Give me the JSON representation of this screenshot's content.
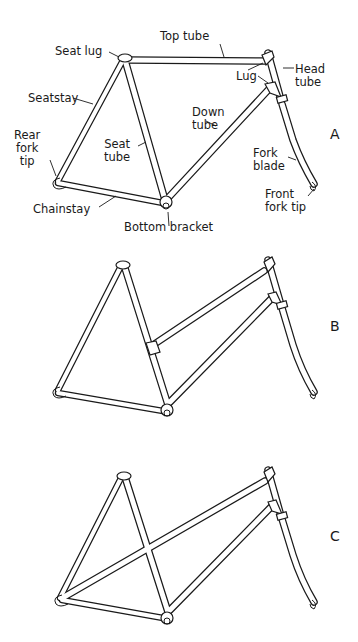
{
  "figure": {
    "panels": [
      {
        "id": "A",
        "letter": "A",
        "description": "Diamond (men's) frame",
        "labels": {
          "seat_lug": "Seat lug",
          "top_tube": "Top tube",
          "head_tube": "Head\ntube",
          "lug": "Lug",
          "seatstay": "Seatstay",
          "down_tube": "Down\ntube",
          "seat_tube": "Seat\ntube",
          "rear_fork_tip": "Rear\nfork\ntip",
          "fork_blade": "Fork\nblade",
          "chainstay": "Chainstay",
          "front_fork_tip": "Front\nfork tip",
          "bottom_bracket": "Bottom bracket"
        }
      },
      {
        "id": "B",
        "letter": "B",
        "description": "Step-through (mixte-style) frame with two parallel tubes"
      },
      {
        "id": "C",
        "letter": "C",
        "description": "Mixte frame with long diagonal tube to rear fork tip"
      }
    ],
    "colors": {
      "line": "#1a1a1a",
      "background": "#ffffff"
    }
  }
}
